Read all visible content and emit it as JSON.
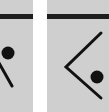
{
  "colors": {
    "tile": "#cfcfcf",
    "bar": "#1e1e1e",
    "glyph": "#111111",
    "background": "#ffffff"
  },
  "tiles": [
    {
      "id": "left",
      "icons": [
        "dot-icon",
        "diagonal-line-icon"
      ]
    },
    {
      "id": "right",
      "icons": [
        "chevron-left-icon",
        "dot-icon"
      ]
    }
  ]
}
